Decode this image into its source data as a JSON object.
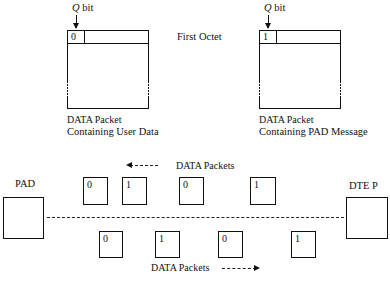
{
  "top": {
    "left_packet": {
      "q_label_italic": "Q",
      "q_label_rest": " bit",
      "q_value": "0",
      "caption_line1": "DATA Packet",
      "caption_line2": "Containing User Data"
    },
    "middle_label": "First Octet",
    "right_packet": {
      "q_label_italic": "Q",
      "q_label_rest": " bit",
      "q_value": "1",
      "caption_line1": "DATA Packet",
      "caption_line2": "Containing PAD Message"
    }
  },
  "bottom": {
    "left_node_label": "PAD",
    "right_node_label": "DTE P",
    "upper_flow": {
      "label": "DATA Packets",
      "direction": "left",
      "packets": [
        "0",
        "1",
        "0",
        "1"
      ]
    },
    "lower_flow": {
      "label": "DATA Packets",
      "direction": "right",
      "packets": [
        "0",
        "1",
        "0",
        "1"
      ]
    }
  }
}
